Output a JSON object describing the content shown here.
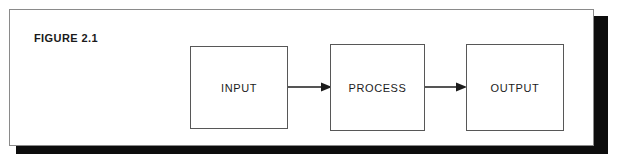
{
  "figure": {
    "caption": "FIGURE 2.1",
    "background_color": "#ffffff",
    "frame_border_color": "#8a8a8a",
    "shadow_color": "#0d0d0d",
    "box_border_color": "#575757",
    "text_color": "#1c1c1c"
  },
  "diagram": {
    "type": "flowchart",
    "orientation": "left-to-right",
    "nodes": [
      {
        "id": "input",
        "label": "INPUT"
      },
      {
        "id": "process",
        "label": "PROCESS"
      },
      {
        "id": "output",
        "label": "OUTPUT"
      }
    ],
    "edges": [
      {
        "from": "input",
        "to": "process",
        "style": "single-arrow"
      },
      {
        "from": "process",
        "to": "output",
        "style": "single-arrow"
      }
    ]
  }
}
